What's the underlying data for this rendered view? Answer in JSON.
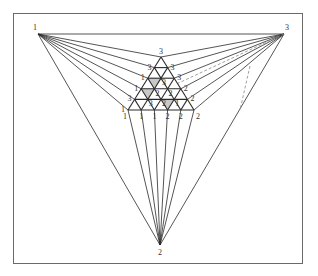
{
  "diagram": {
    "title": "",
    "colors": {
      "line": "#2a2a2a",
      "frame": "#6a6a6a",
      "shade": "#9a9a9a",
      "dashed": "#888888"
    },
    "outer_vertices": [
      {
        "label": "1",
        "x": 38,
        "y": 34
      },
      {
        "label": "3",
        "x": 284,
        "y": 34
      },
      {
        "label": "2",
        "x": 160,
        "y": 245
      }
    ],
    "inner_triangle": {
      "apex": {
        "x": 161,
        "y": 57
      },
      "base_left": {
        "x": 128,
        "y": 110
      },
      "base_right": {
        "x": 194,
        "y": 110
      },
      "subdivisions": 5,
      "left_side_labels": [
        "3",
        "3",
        "1",
        "1",
        "3",
        "1"
      ],
      "right_side_labels": [
        "3",
        "3",
        "3",
        "2",
        "2",
        "2"
      ],
      "bottom_labels": [
        "1",
        "1",
        "1",
        "2",
        "2",
        "2"
      ],
      "interior_labels": [
        "3",
        "2",
        "2",
        "3",
        "2",
        "1",
        "2",
        "3",
        "2"
      ],
      "shaded_cells": [
        {
          "row": 2,
          "index": 1
        },
        {
          "row": 3,
          "index": 1
        },
        {
          "row": 4,
          "index": 3
        }
      ]
    }
  }
}
